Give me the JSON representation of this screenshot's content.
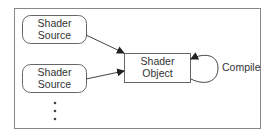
{
  "diagram": {
    "sources": [
      {
        "line1": "Shader",
        "line2": "Source"
      },
      {
        "line1": "Shader",
        "line2": "Source"
      }
    ],
    "target": {
      "line1": "Shader",
      "line2": "Object"
    },
    "loop_label": "Compile",
    "ellipsis": "⋮",
    "colors": {
      "stroke": "#555555",
      "frame": "#888888",
      "text": "#333333"
    }
  }
}
